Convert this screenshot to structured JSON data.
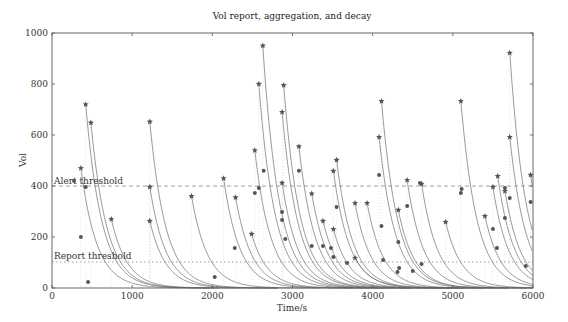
{
  "chart_data": {
    "type": "scatter",
    "title": "Vol report, aggregation, and decay",
    "xlabel": "Time/s",
    "ylabel": "Vol",
    "xlim": [
      0,
      6000
    ],
    "ylim": [
      0,
      1000
    ],
    "xticks": [
      0,
      1000,
      2000,
      3000,
      4000,
      5000,
      6000
    ],
    "yticks": [
      0,
      200,
      400,
      600,
      800,
      1000
    ],
    "grid": false,
    "annotations": [
      {
        "text": "Alert threshold",
        "y": 400,
        "style": "dashed"
      },
      {
        "text": "Report threshold",
        "y": 100,
        "style": "dotted"
      }
    ],
    "series": [
      {
        "name": "Aggregated vol (star)",
        "marker": "star",
        "points": [
          [
            360,
            470
          ],
          [
            420,
            720
          ],
          [
            485,
            648
          ],
          [
            740,
            270
          ],
          [
            1220,
            652
          ],
          [
            1220,
            396
          ],
          [
            1220,
            263
          ],
          [
            1740,
            360
          ],
          [
            2140,
            430
          ],
          [
            2290,
            355
          ],
          [
            2490,
            212
          ],
          [
            2530,
            540
          ],
          [
            2580,
            800
          ],
          [
            2630,
            950
          ],
          [
            2870,
            690
          ],
          [
            2890,
            795
          ],
          [
            2870,
            412
          ],
          [
            3080,
            555
          ],
          [
            3240,
            370
          ],
          [
            3380,
            263
          ],
          [
            3510,
            459
          ],
          [
            3550,
            502
          ],
          [
            3510,
            231
          ],
          [
            3780,
            333
          ],
          [
            3780,
            118
          ],
          [
            3930,
            333
          ],
          [
            4080,
            592
          ],
          [
            4110,
            733
          ],
          [
            4320,
            306
          ],
          [
            4430,
            423
          ],
          [
            4610,
            408
          ],
          [
            4910,
            259
          ],
          [
            5100,
            733
          ],
          [
            5400,
            282
          ],
          [
            5500,
            396
          ],
          [
            5560,
            439
          ],
          [
            5650,
            380
          ],
          [
            5710,
            592
          ],
          [
            5710,
            922
          ],
          [
            5970,
            443
          ]
        ]
      },
      {
        "name": "Reported vol (dot)",
        "marker": "circle",
        "points": [
          [
            275,
            420
          ],
          [
            360,
            200
          ],
          [
            420,
            396
          ],
          [
            450,
            24
          ],
          [
            2030,
            43
          ],
          [
            2280,
            157
          ],
          [
            2530,
            373
          ],
          [
            2580,
            392
          ],
          [
            2640,
            460
          ],
          [
            2870,
            298
          ],
          [
            2870,
            267
          ],
          [
            2910,
            192
          ],
          [
            3080,
            460
          ],
          [
            3240,
            165
          ],
          [
            3380,
            165
          ],
          [
            3480,
            157
          ],
          [
            3510,
            122
          ],
          [
            3550,
            318
          ],
          [
            3680,
            98
          ],
          [
            4080,
            443
          ],
          [
            4110,
            243
          ],
          [
            4130,
            110
          ],
          [
            4310,
            63
          ],
          [
            4330,
            78
          ],
          [
            4320,
            180
          ],
          [
            4430,
            322
          ],
          [
            4500,
            67
          ],
          [
            4590,
            412
          ],
          [
            4610,
            94
          ],
          [
            5100,
            373
          ],
          [
            5110,
            388
          ],
          [
            5500,
            231
          ],
          [
            5550,
            157
          ],
          [
            5650,
            392
          ],
          [
            5650,
            275
          ],
          [
            5710,
            353
          ],
          [
            5910,
            86
          ],
          [
            5970,
            337
          ]
        ]
      }
    ],
    "colors": {
      "axis": "#555555",
      "curve": "#6e6e6e",
      "marker": "#555555",
      "threshold": "#888888"
    }
  }
}
